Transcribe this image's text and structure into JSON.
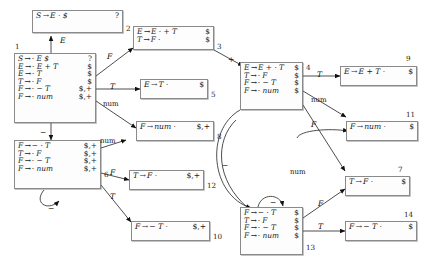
{
  "diagram": {
    "kind": "lr-parser-automaton",
    "grammar_symbols": {
      "nonterminals": [
        "S",
        "E",
        "T",
        "F"
      ],
      "terminals": [
        "+",
        "-",
        "num",
        "$"
      ]
    },
    "dot": "·",
    "prod_arrow": "→"
  },
  "states": [
    {
      "id": "2",
      "number": "2",
      "items": [
        {
          "lhs": "S",
          "rhs": "E · $",
          "lookahead": "?"
        }
      ]
    },
    {
      "id": "1",
      "number": "1",
      "items": [
        {
          "lhs": "S",
          "rhs": "· E $",
          "lookahead": "?"
        },
        {
          "lhs": "E",
          "rhs": "· E + T",
          "lookahead": "$"
        },
        {
          "lhs": "E",
          "rhs": "· T",
          "lookahead": "$"
        },
        {
          "lhs": "T",
          "rhs": "· F",
          "lookahead": "$"
        },
        {
          "lhs": "F",
          "rhs": "· − T",
          "lookahead": "$,+"
        },
        {
          "lhs": "F",
          "rhs": "· num",
          "lookahead": "$,+"
        }
      ]
    },
    {
      "id": "6",
      "number": "6",
      "items": [
        {
          "lhs": "F",
          "rhs": "− · T",
          "lookahead": "$,+"
        },
        {
          "lhs": "T",
          "rhs": "· F",
          "lookahead": "$,+"
        },
        {
          "lhs": "F",
          "rhs": "· − T",
          "lookahead": "$,+"
        },
        {
          "lhs": "F",
          "rhs": "· num",
          "lookahead": "$,+"
        }
      ]
    },
    {
      "id": "3",
      "number": "3",
      "items": [
        {
          "lhs": "E",
          "rhs": "E · + T",
          "lookahead": "$"
        },
        {
          "lhs": "T",
          "rhs": "F ·",
          "lookahead": "$"
        }
      ]
    },
    {
      "id": "5",
      "number": "5",
      "items": [
        {
          "lhs": "E",
          "rhs": "T ·",
          "lookahead": "$"
        }
      ]
    },
    {
      "id": "8",
      "number": "8",
      "items": [
        {
          "lhs": "F",
          "rhs": "num ·",
          "lookahead": "$,+"
        }
      ]
    },
    {
      "id": "12",
      "number": "12",
      "items": [
        {
          "lhs": "T",
          "rhs": "F ·",
          "lookahead": "$,+"
        }
      ]
    },
    {
      "id": "10",
      "number": "10",
      "items": [
        {
          "lhs": "F",
          "rhs": "− T ·",
          "lookahead": "$,+"
        }
      ]
    },
    {
      "id": "4",
      "number": "4",
      "items": [
        {
          "lhs": "E",
          "rhs": "E + · T",
          "lookahead": "$"
        },
        {
          "lhs": "T",
          "rhs": "· F",
          "lookahead": "$"
        },
        {
          "lhs": "F",
          "rhs": "· − T",
          "lookahead": "$"
        },
        {
          "lhs": "F",
          "rhs": "· num",
          "lookahead": "$"
        }
      ]
    },
    {
      "id": "13",
      "number": "13",
      "items": [
        {
          "lhs": "F",
          "rhs": "− · T",
          "lookahead": "$"
        },
        {
          "lhs": "T",
          "rhs": "· F",
          "lookahead": "$"
        },
        {
          "lhs": "F",
          "rhs": "· − T",
          "lookahead": "$"
        },
        {
          "lhs": "F",
          "rhs": "· num",
          "lookahead": "$"
        }
      ]
    },
    {
      "id": "9",
      "number": "9",
      "items": [
        {
          "lhs": "E",
          "rhs": "E + T ·",
          "lookahead": "$"
        }
      ]
    },
    {
      "id": "11",
      "number": "11",
      "items": [
        {
          "lhs": "F",
          "rhs": "num ·",
          "lookahead": "$"
        }
      ]
    },
    {
      "id": "7",
      "number": "7",
      "items": [
        {
          "lhs": "T",
          "rhs": "F ·",
          "lookahead": "$"
        }
      ]
    },
    {
      "id": "14",
      "number": "14",
      "items": [
        {
          "lhs": "F",
          "rhs": "− T ·",
          "lookahead": "$"
        }
      ]
    }
  ],
  "edges": [
    {
      "from": "1",
      "to": "2",
      "label": "E",
      "type": "nonterminal"
    },
    {
      "from": "1",
      "to": "3",
      "label": "F",
      "type": "nonterminal"
    },
    {
      "from": "1",
      "to": "5",
      "label": "T",
      "type": "nonterminal"
    },
    {
      "from": "1",
      "to": "8",
      "label": "num",
      "type": "terminal"
    },
    {
      "from": "1",
      "to": "6",
      "label": "−",
      "type": "terminal"
    },
    {
      "from": "3",
      "to": "4",
      "label": "+",
      "type": "terminal"
    },
    {
      "from": "6",
      "to": "6",
      "label": "−",
      "type": "terminal"
    },
    {
      "from": "6",
      "to": "8",
      "label": "num",
      "type": "terminal"
    },
    {
      "from": "6",
      "to": "12",
      "label": "F",
      "type": "nonterminal"
    },
    {
      "from": "6",
      "to": "10",
      "label": "T",
      "type": "nonterminal"
    },
    {
      "from": "4",
      "to": "9",
      "label": "T",
      "type": "nonterminal"
    },
    {
      "from": "4",
      "to": "11",
      "label": "num",
      "type": "terminal"
    },
    {
      "from": "4",
      "to": "7",
      "label": "F",
      "type": "nonterminal"
    },
    {
      "from": "4",
      "to": "13",
      "label": "−",
      "type": "terminal"
    },
    {
      "from": "13",
      "to": "13",
      "label": "−",
      "type": "terminal"
    },
    {
      "from": "13",
      "to": "11",
      "label": "num",
      "type": "terminal"
    },
    {
      "from": "13",
      "to": "7",
      "label": "F",
      "type": "nonterminal"
    },
    {
      "from": "13",
      "to": "14",
      "label": "T",
      "type": "nonterminal"
    }
  ],
  "edge_labels": [
    {
      "name": "edge-label-1-E",
      "text": "E",
      "x": 60,
      "y": 36
    },
    {
      "name": "edge-label-1-F",
      "text": "F",
      "x": 107,
      "y": 52
    },
    {
      "name": "edge-label-1-T",
      "text": "T",
      "x": 110,
      "y": 82
    },
    {
      "name": "edge-label-1-num",
      "text": "num",
      "x": 103,
      "y": 100
    },
    {
      "name": "edge-label-1-minus",
      "text": "−",
      "x": 40,
      "y": 128
    },
    {
      "name": "edge-label-3-plus",
      "text": "+",
      "x": 228,
      "y": 55
    },
    {
      "name": "edge-label-6-num",
      "text": "num",
      "x": 100,
      "y": 137
    },
    {
      "name": "edge-label-6-F",
      "text": "F",
      "x": 110,
      "y": 168
    },
    {
      "name": "edge-label-6-T",
      "text": "T",
      "x": 110,
      "y": 192
    },
    {
      "name": "edge-label-6-self",
      "text": "−",
      "x": 48,
      "y": 204
    },
    {
      "name": "edge-label-4-T",
      "text": "T",
      "x": 317,
      "y": 70
    },
    {
      "name": "edge-label-4-num",
      "text": "num",
      "x": 311,
      "y": 96
    },
    {
      "name": "edge-label-4-F",
      "text": "F",
      "x": 311,
      "y": 120
    },
    {
      "name": "edge-label-4-minus",
      "text": "−",
      "x": 222,
      "y": 161
    },
    {
      "name": "edge-label-13-num",
      "text": "num",
      "x": 290,
      "y": 168
    },
    {
      "name": "edge-label-13-F",
      "text": "F",
      "x": 318,
      "y": 199
    },
    {
      "name": "edge-label-13-T",
      "text": "T",
      "x": 318,
      "y": 222
    },
    {
      "name": "edge-label-13-self",
      "text": "−",
      "x": 270,
      "y": 198
    }
  ]
}
